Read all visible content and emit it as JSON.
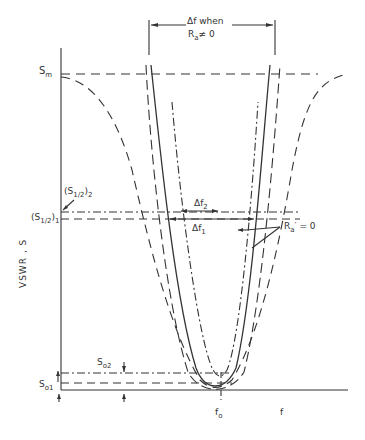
{
  "diagram": {
    "title_annotation": {
      "line1": "Δf when",
      "line2_pre": "R",
      "line2_sub": "a",
      "line2_post": "≠ 0"
    },
    "y_axis_label": "VSWR , S",
    "labels": {
      "Sm": {
        "main": "S",
        "sub": "m"
      },
      "S_half_2": {
        "pre": "(S",
        "sub": "1/2",
        "post": ")",
        "sub2": "2"
      },
      "S_half_1": {
        "pre": "(S",
        "sub": "1/2",
        "post": ")",
        "sub2": "1"
      },
      "So1": {
        "main": "S",
        "sub": "o1"
      },
      "So2": {
        "main": "S",
        "sub": "o2"
      },
      "df2": {
        "main": "Δf",
        "sub": "2"
      },
      "df1": {
        "main": "Δf",
        "sub": "1"
      },
      "Ra_zero": {
        "pre": "R",
        "sub": "a",
        "post": "′ = 0"
      },
      "f0": {
        "main": "f",
        "sub": "o"
      },
      "f": "f"
    },
    "legend_styles": {
      "solid": "curve with R'a = 0 (narrow)",
      "dash_dot": "curve 2 (S_o2)",
      "dashed": "curve with Ra ≠ 0 (wide)"
    },
    "colors": {
      "line": "#333333",
      "background": "#ffffff"
    }
  }
}
